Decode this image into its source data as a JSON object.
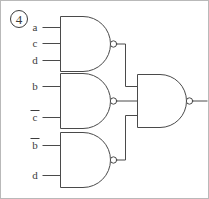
{
  "figure": {
    "label": "4",
    "label_style": "circled-number",
    "type": "logic-circuit-diagram",
    "background_color": "#ffffff",
    "line_color": "#4a4a4a",
    "text_color": "#3c3c3c"
  },
  "circuit": {
    "gate_type": "NAND",
    "gate_count": 4,
    "output_label": "",
    "gates": [
      {
        "id": "gate-top",
        "name": "nand-gate-top",
        "type": "NAND",
        "inputs": [
          {
            "label": "a",
            "overbar": false
          },
          {
            "label": "c",
            "overbar": false
          },
          {
            "label": "d",
            "overbar": false
          }
        ]
      },
      {
        "id": "gate-middle",
        "name": "nand-gate-middle",
        "type": "NAND",
        "inputs": [
          {
            "label": "b",
            "overbar": false
          },
          {
            "label": "c",
            "overbar": true
          }
        ]
      },
      {
        "id": "gate-bottom",
        "name": "nand-gate-bottom",
        "type": "NAND",
        "inputs": [
          {
            "label": "b",
            "overbar": true
          },
          {
            "label": "d",
            "overbar": false
          }
        ]
      },
      {
        "id": "gate-output",
        "name": "nand-gate-output",
        "type": "NAND",
        "inputs": [
          {
            "label": "",
            "overbar": false
          },
          {
            "label": "",
            "overbar": false
          },
          {
            "label": "",
            "overbar": false
          }
        ]
      }
    ],
    "input_labels": [
      "a",
      "c",
      "d",
      "b",
      "c̄",
      "b̄",
      "d"
    ]
  }
}
